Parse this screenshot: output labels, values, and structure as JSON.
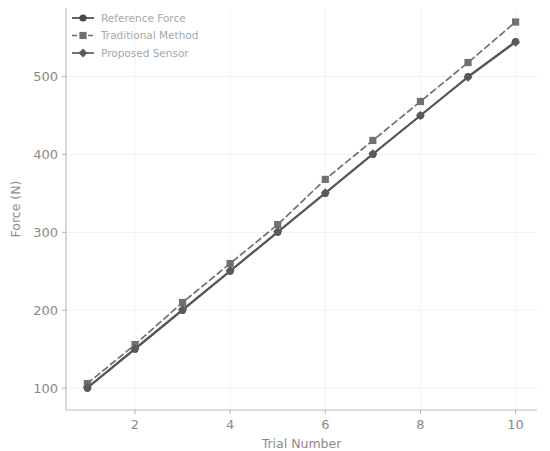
{
  "chart_data": {
    "type": "line",
    "title": "",
    "xlabel": "Trial Number",
    "ylabel": "Force (N)",
    "x": [
      1,
      2,
      3,
      4,
      5,
      6,
      7,
      8,
      9,
      10
    ],
    "xlim": [
      0.55,
      10.45
    ],
    "ylim": [
      72,
      588
    ],
    "xticks": [
      2,
      4,
      6,
      8,
      10
    ],
    "xtick_labels": [
      "2",
      "4",
      "6",
      "8",
      "10"
    ],
    "yticks": [
      100,
      200,
      300,
      400,
      500
    ],
    "ytick_labels": [
      "100",
      "200",
      "300",
      "400",
      "500"
    ],
    "grid": true,
    "legend_position": "upper left",
    "series": [
      {
        "name": "Reference Force",
        "values": [
          100,
          150,
          200,
          250,
          300,
          350,
          400,
          450,
          500,
          545
        ],
        "color": "#4a4a4a",
        "linestyle": "solid",
        "marker": "circle"
      },
      {
        "name": "Traditional Method",
        "values": [
          106,
          156,
          210,
          260,
          310,
          368,
          418,
          468,
          518,
          570
        ],
        "color": "#707070",
        "linestyle": "dashed",
        "marker": "square"
      },
      {
        "name": "Proposed Sensor",
        "values": [
          101,
          151,
          201,
          251,
          301,
          351,
          401,
          450,
          499,
          544
        ],
        "color": "#5a5a5a",
        "linestyle": "solid",
        "marker": "diamond"
      }
    ]
  },
  "legend": {
    "entries": [
      {
        "label": "Reference Force"
      },
      {
        "label": "Traditional Method"
      },
      {
        "label": "Proposed Sensor"
      }
    ]
  },
  "axes": {
    "x_title": "Trial Number",
    "y_title": "Force (N)"
  }
}
